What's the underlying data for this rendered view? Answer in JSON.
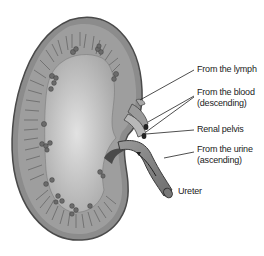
{
  "diagram": {
    "labels": {
      "lymph": "From the lymph",
      "blood_line1": "From the blood",
      "blood_line2": "(descending)",
      "pelvis": "Renal pelvis",
      "urine_line1": "From the urine",
      "urine_line2": "(ascending)",
      "ureter": "Ureter"
    },
    "colors": {
      "outline": "#4a4a4a",
      "cortex": "#8c8c8c",
      "medulla_light": "#d6d6d6",
      "pelvis_fill": "#bdbdbd",
      "glomeruli": "#6b6b6b",
      "ureter": "#8a8a8a",
      "label_text": "#222222"
    }
  }
}
